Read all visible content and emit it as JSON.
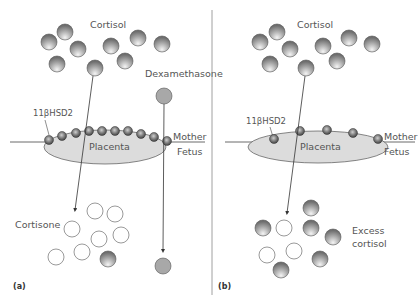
{
  "panels": [
    {
      "id": "a",
      "panel_label": "(a)",
      "top_label": "Cortisol",
      "enzyme_label": "11βHSD2",
      "placenta_label": "Placenta",
      "mother_label": "Mother",
      "fetus_label": "Fetus",
      "drug_label": "Dexamethasone",
      "bottom_label": "Cortisone",
      "enzyme_count": 10,
      "description": "Dense 11βHSD2 converts cortisol to inactive cortisone; dexamethasone crosses unchanged"
    },
    {
      "id": "b",
      "panel_label": "(b)",
      "top_label": "Cortisol",
      "enzyme_label": "11βHSD2",
      "placenta_label": "Placenta",
      "mother_label": "Mother",
      "fetus_label": "Fetus",
      "bottom_label_line1": "Excess",
      "bottom_label_line2": "cortisol",
      "enzyme_count": 5,
      "description": "Reduced 11βHSD2 allows excess cortisol to reach fetus"
    }
  ],
  "colors": {
    "cortisol_dark": "#6e6e6e",
    "cortisol_light": "#f2f2f2",
    "dexamethasone": "#a8a8a8",
    "placenta_fill": "#dcdcdc",
    "enzyme": "#666666",
    "line": "#444444"
  }
}
